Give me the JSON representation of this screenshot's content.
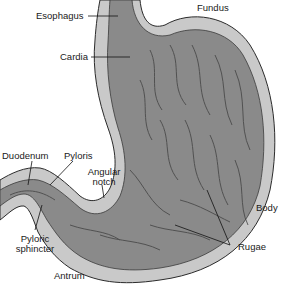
{
  "diagram": {
    "colors": {
      "outer_wall": "#c9c9c9",
      "inner_lining": "#8a8a8a",
      "rugae_fold": "#5e5e5e",
      "outline": "#2b2b2b",
      "leader_line": "#111111",
      "label_text": "#1a1a1a"
    },
    "labels": {
      "esophagus": "Esophagus",
      "fundus": "Fundus",
      "cardia": "Cardia",
      "duodenum": "Duodenum",
      "pyloris": "Pyloris",
      "angular_notch_line1": "Angular",
      "angular_notch_line2": "notch",
      "body": "Body",
      "pyloric_sphincter_line1": "Pyloric",
      "pyloric_sphincter_line2": "sphincter",
      "rugae": "Rugae",
      "antrum": "Antrum"
    }
  }
}
